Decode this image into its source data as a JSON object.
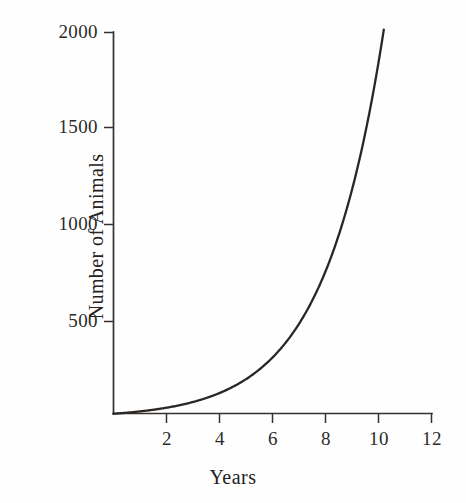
{
  "figure": {
    "background_color": "#fefefe",
    "ink_color": "#2b2b2b",
    "curve_color": "#2a2624"
  },
  "chart_data": {
    "type": "line",
    "title": "",
    "subtitle": "",
    "xlabel": "Years",
    "ylabel": "Number of Animals",
    "xlim": [
      0,
      12
    ],
    "ylim": [
      0,
      2000
    ],
    "xticks": [
      2,
      4,
      6,
      8,
      10,
      12
    ],
    "xtick_labels": [
      "2",
      "4",
      "6",
      "8",
      "10",
      "12"
    ],
    "yticks": [
      500,
      1000,
      1500,
      2000
    ],
    "ytick_labels": [
      "500",
      "1000",
      "1500",
      "2000"
    ],
    "grid": false,
    "legend": null,
    "legend_position": "none",
    "annotations": [],
    "series": [
      {
        "name": "Exponential population growth",
        "model": "N = 22 * e^(0.443 * t)",
        "x": [
          0,
          0.5,
          1,
          1.5,
          2,
          2.5,
          3,
          3.5,
          4,
          4.5,
          5,
          5.5,
          6,
          6.5,
          7,
          7.5,
          8,
          8.5,
          9,
          9.5,
          10,
          10.2
        ],
        "values": [
          22,
          27,
          34,
          43,
          53,
          67,
          83,
          104,
          130,
          162,
          202,
          252,
          314,
          392,
          489,
          610,
          761,
          949,
          1184,
          1477,
          1843,
          2015
        ]
      }
    ]
  },
  "axis_labels": {
    "x": [
      "2",
      "4",
      "6",
      "8",
      "10",
      "12"
    ],
    "y": [
      "2000",
      "1500",
      "1000",
      "500"
    ]
  },
  "titles": {
    "x_axis": "Years",
    "y_axis": "Number of Animals"
  }
}
